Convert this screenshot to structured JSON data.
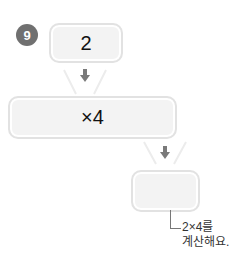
{
  "problem": {
    "number": "9",
    "start_value": "2",
    "operation": "×4",
    "result_value": "",
    "hint_line1": "2×4를",
    "hint_line2": "계산해요."
  },
  "colors": {
    "badge": "#707070",
    "box_fill": "#f3f3f3",
    "box_border": "#e2e2e2",
    "arrow": "#7a7a7a"
  }
}
